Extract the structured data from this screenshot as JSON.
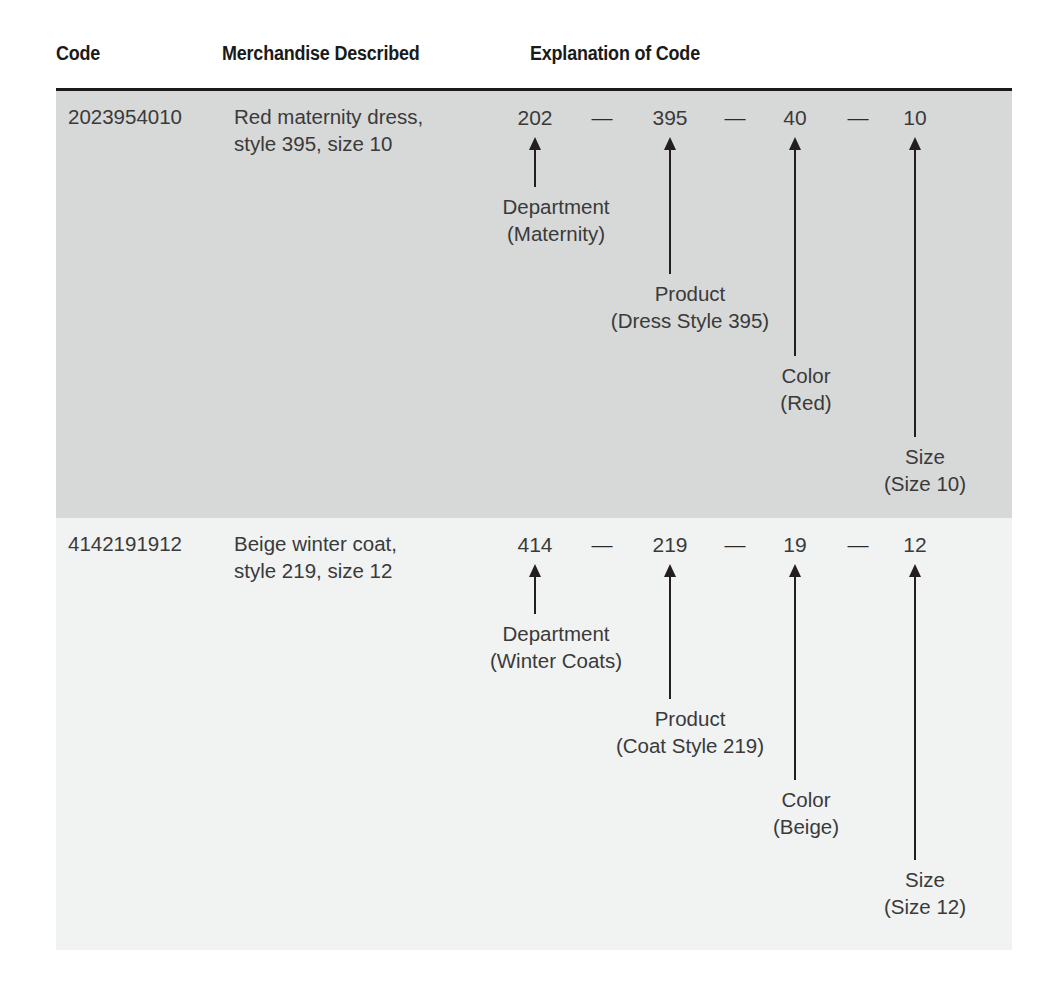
{
  "table": {
    "headers": {
      "code": "Code",
      "merchandise": "Merchandise Described",
      "explanation": "Explanation of Code"
    },
    "rows": [
      {
        "code": "2023954010",
        "merchandise": "Red maternity dress,\nstyle 395, size 10",
        "segments": [
          {
            "value": "202",
            "label": "Department",
            "detail": "(Maternity)"
          },
          {
            "value": "395",
            "label": "Product",
            "detail": "(Dress Style 395)"
          },
          {
            "value": "40",
            "label": "Color",
            "detail": "(Red)"
          },
          {
            "value": "10",
            "label": "Size",
            "detail": "(Size 10)"
          }
        ],
        "separator": "—"
      },
      {
        "code": "4142191912",
        "merchandise": "Beige winter coat,\nstyle 219, size 12",
        "segments": [
          {
            "value": "414",
            "label": "Department",
            "detail": "(Winter Coats)"
          },
          {
            "value": "219",
            "label": "Product",
            "detail": "(Coat Style 219)"
          },
          {
            "value": "19",
            "label": "Color",
            "detail": "(Beige)"
          },
          {
            "value": "12",
            "label": "Size",
            "detail": "(Size 12)"
          }
        ],
        "separator": "—"
      }
    ]
  },
  "colors": {
    "rule": "#1a1a1a",
    "shaded_row_bg": "#d7d8d8",
    "plain_row_bg": "#f1f2f2",
    "text": "#3a3a3a",
    "arrow": "#231f20",
    "page_bg": "#ffffff"
  }
}
